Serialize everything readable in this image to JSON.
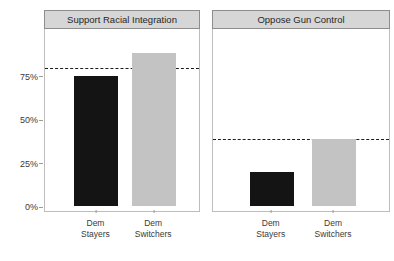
{
  "chart_data": {
    "type": "bar",
    "title": "",
    "xlabel": "",
    "ylabel": "",
    "ylim": [
      0,
      100
    ],
    "grid": false,
    "legend": "none",
    "ytick_labels": [
      "0%",
      "25%",
      "50%",
      "75%"
    ],
    "ytick_values": [
      0,
      25,
      50,
      75
    ],
    "categories": [
      "Dem Stayers",
      "Dem Switchers"
    ],
    "panels": [
      {
        "facet_label": "Support Racial Integration",
        "categories": [
          "Dem Stayers",
          "Dem Switchers"
        ],
        "category_lines": [
          [
            "Dem",
            "Stayers"
          ],
          [
            "Dem",
            "Switchers"
          ]
        ],
        "values": [
          75,
          88
        ],
        "colors": [
          "#141414",
          "#c3c3c3"
        ],
        "reference_line": 81
      },
      {
        "facet_label": "Oppose Gun Control",
        "categories": [
          "Dem Stayers",
          "Dem Switchers"
        ],
        "category_lines": [
          [
            "Dem",
            "Stayers"
          ],
          [
            "Dem",
            "Switchers"
          ]
        ],
        "values": [
          20,
          39
        ],
        "colors": [
          "#141414",
          "#c3c3c3"
        ],
        "reference_line": 40
      }
    ]
  },
  "style": {
    "strip_fill": "#d6d6d6",
    "strip_border": "#8d8d8d",
    "panel_border": "#bdbdbd",
    "dark_bar": "#141414",
    "light_bar": "#c3c3c3",
    "reference_line_color": "#1c1c1c",
    "background": "#ffffff",
    "text": "#3a3a3a"
  }
}
